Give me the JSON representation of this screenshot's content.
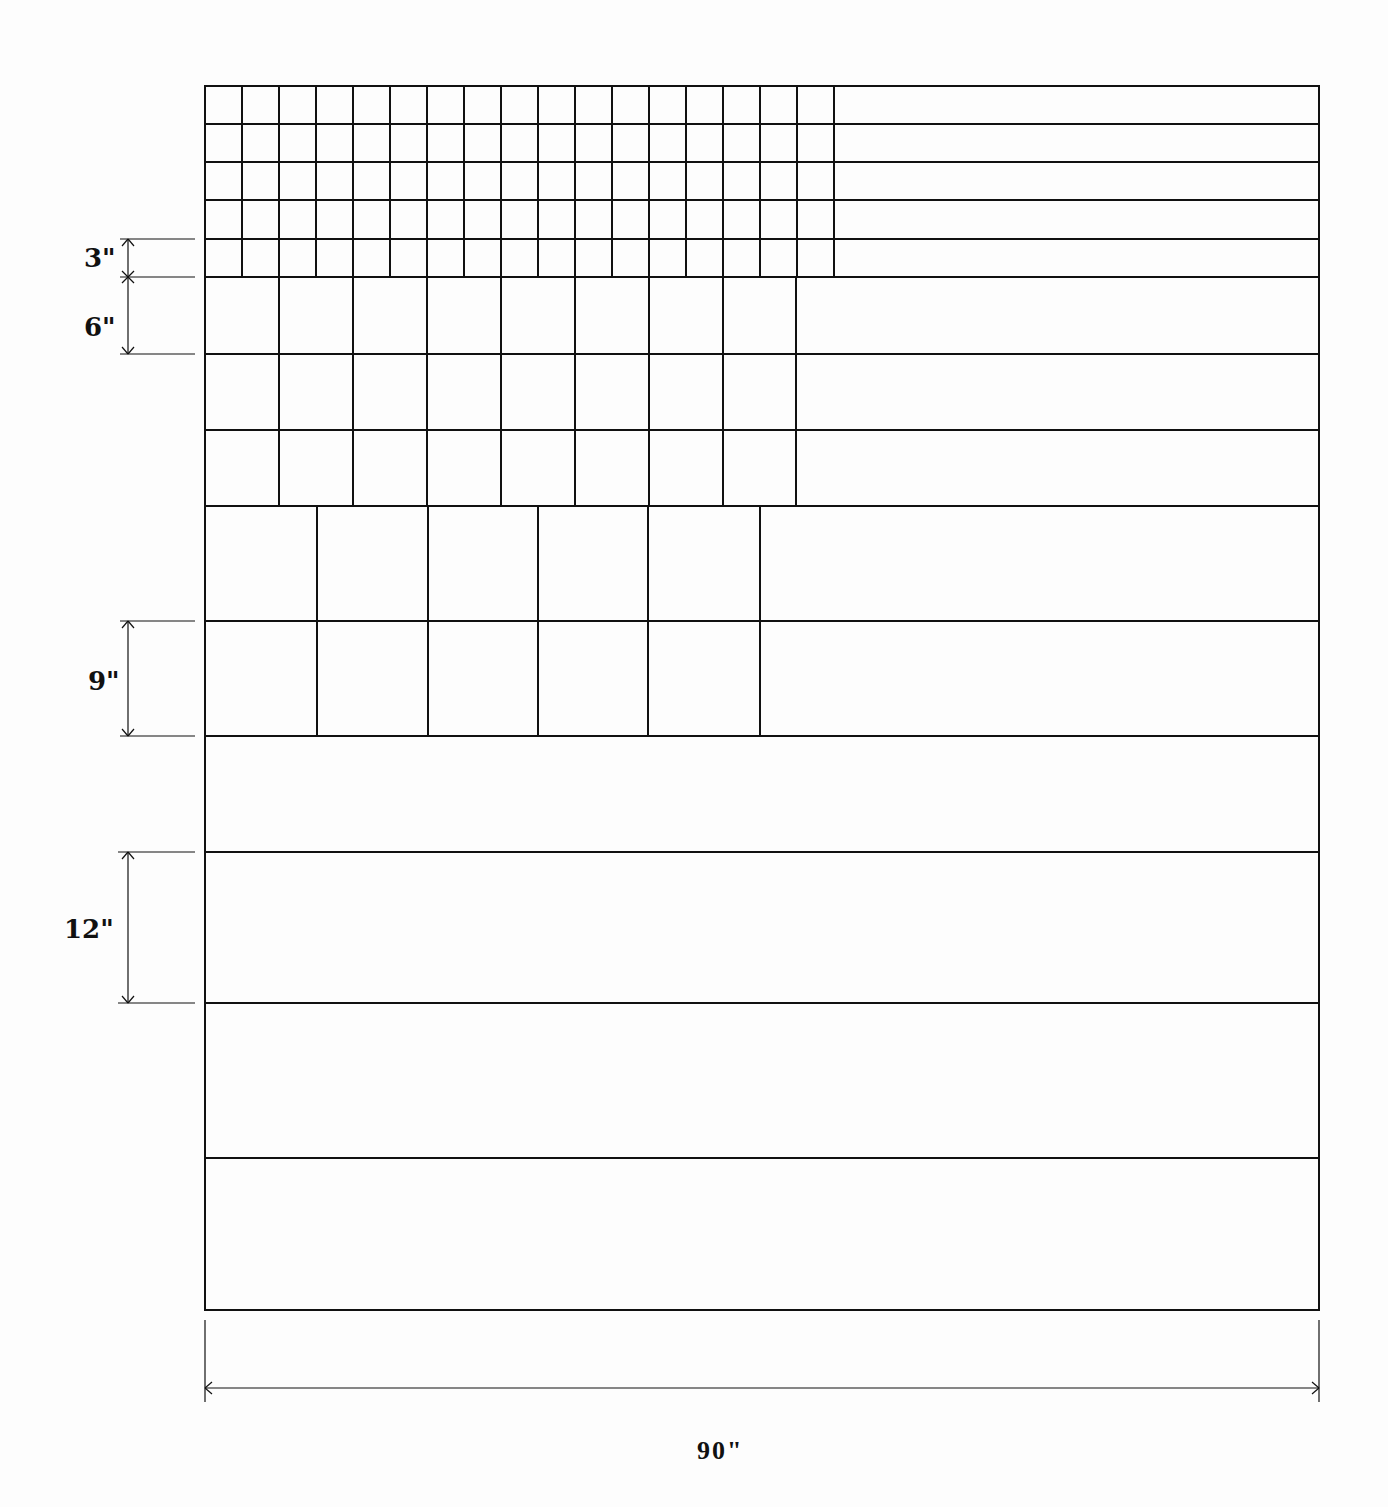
{
  "diagram": {
    "title": "",
    "frame": {
      "x0": 205,
      "y0": 86,
      "x1": 1319,
      "y1": 1310,
      "width_label": "90\""
    },
    "sections": [
      {
        "name": "3-inch-grid",
        "label": "3\"",
        "rows": 5,
        "row_height": 38.2,
        "y_start": 86,
        "cols": 17,
        "x_end": 834
      },
      {
        "name": "6-inch-grid",
        "label": "6\"",
        "rows": 3,
        "row_height": 76.3,
        "y_start": 277,
        "cols": 8,
        "x_end": 796
      },
      {
        "name": "9-inch-grid",
        "label": "9\"",
        "rows": 2,
        "row_height": 115,
        "y_start": 506,
        "cols": 5,
        "x_end": 760
      },
      {
        "name": "12-inch-bands",
        "label": "12\"",
        "rows": 4,
        "row_height": 143.5,
        "y_start": 736,
        "cols": 0,
        "x_end": 1319
      }
    ],
    "dimension_labels": {
      "three": "3\"",
      "six": "6\"",
      "nine": "9\"",
      "twelve": "12\"",
      "ninety": "90\""
    },
    "line_color": "#111111",
    "background": "#fdfdfd"
  }
}
